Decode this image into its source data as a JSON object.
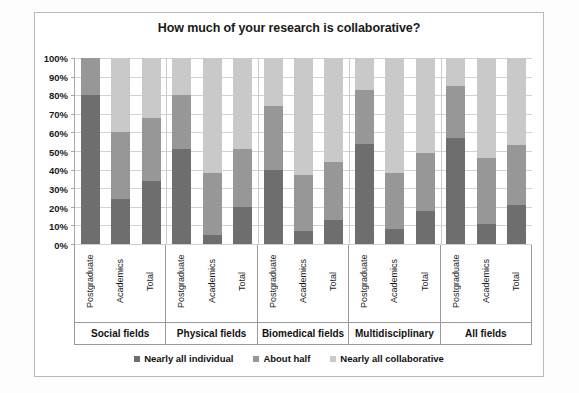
{
  "chart": {
    "title": "How much of your research is collaborative?"
  },
  "legend": {
    "items": [
      {
        "label": "Nearly all individual",
        "color": "#6e6e6e"
      },
      {
        "label": "About half",
        "color": "#979797"
      },
      {
        "label": "Nearly all collaborative",
        "color": "#c9c9c9"
      }
    ]
  },
  "yaxis": {
    "ticks": [
      "100%",
      "90%",
      "80%",
      "70%",
      "60%",
      "50%",
      "40%",
      "30%",
      "20%",
      "10%",
      "0%"
    ]
  },
  "chart_data": {
    "type": "bar",
    "subtype": "stacked-percent",
    "title": "How much of your research is collaborative?",
    "xlabel": "",
    "ylabel": "",
    "ylim": [
      0,
      100
    ],
    "ytick_values": [
      0,
      10,
      20,
      30,
      40,
      50,
      60,
      70,
      80,
      90,
      100
    ],
    "ytick_labels": [
      "0%",
      "10%",
      "20%",
      "30%",
      "40%",
      "50%",
      "60%",
      "70%",
      "80%",
      "90%",
      "100%"
    ],
    "grid": true,
    "legend_position": "bottom",
    "groups": [
      "Social fields",
      "Physical fields",
      "Biomedical fields",
      "Multidisciplinary",
      "All fields"
    ],
    "categories": [
      "Postgraduate",
      "Academics",
      "Total"
    ],
    "series": [
      {
        "name": "Nearly all individual",
        "color": "#6e6e6e"
      },
      {
        "name": "About half",
        "color": "#979797"
      },
      {
        "name": "Nearly all collaborative",
        "color": "#c9c9c9"
      }
    ],
    "bars": [
      {
        "group": "Social fields",
        "category": "Postgraduate",
        "values": [
          80,
          20,
          0
        ]
      },
      {
        "group": "Social fields",
        "category": "Academics",
        "values": [
          24,
          36,
          40
        ]
      },
      {
        "group": "Social fields",
        "category": "Total",
        "values": [
          34,
          34,
          32
        ]
      },
      {
        "group": "Physical fields",
        "category": "Postgraduate",
        "values": [
          51,
          29,
          20
        ]
      },
      {
        "group": "Physical fields",
        "category": "Academics",
        "values": [
          5,
          33,
          62
        ]
      },
      {
        "group": "Physical fields",
        "category": "Total",
        "values": [
          20,
          31,
          49
        ]
      },
      {
        "group": "Biomedical fields",
        "category": "Postgraduate",
        "values": [
          40,
          34,
          26
        ]
      },
      {
        "group": "Biomedical fields",
        "category": "Academics",
        "values": [
          7,
          30,
          63
        ]
      },
      {
        "group": "Biomedical fields",
        "category": "Total",
        "values": [
          13,
          31,
          56
        ]
      },
      {
        "group": "Multidisciplinary",
        "category": "Postgraduate",
        "values": [
          54,
          29,
          17
        ]
      },
      {
        "group": "Multidisciplinary",
        "category": "Academics",
        "values": [
          8,
          30,
          62
        ]
      },
      {
        "group": "Multidisciplinary",
        "category": "Total",
        "values": [
          18,
          31,
          51
        ]
      },
      {
        "group": "All fields",
        "category": "Postgraduate",
        "values": [
          57,
          28,
          15
        ]
      },
      {
        "group": "All fields",
        "category": "Academics",
        "values": [
          11,
          35,
          54
        ]
      },
      {
        "group": "All fields",
        "category": "Total",
        "values": [
          21,
          32,
          47
        ]
      }
    ]
  }
}
